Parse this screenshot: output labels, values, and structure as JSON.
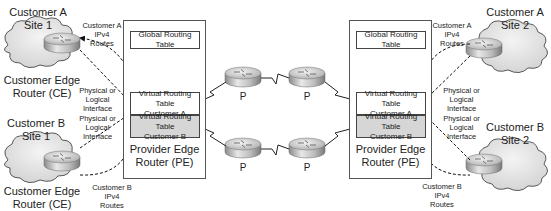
{
  "diagram": {
    "left_customer_a": {
      "site": "Customer A\nSite 1",
      "ce_label": "Customer Edge\nRouter (CE)",
      "routes": "Customer A\nIPv4 Routes",
      "interface": "Physical or\nLogical Interface"
    },
    "left_customer_b": {
      "site": "Customer B\nSite 1",
      "ce_label": "Customer Edge\nRouter (CE)",
      "routes": "Customer B\nIPv4 Routes",
      "interface": "Physical or\nLogical Interface"
    },
    "right_customer_a": {
      "site": "Customer A\nSite 2",
      "routes": "Customer A\nIPv4 Routes",
      "interface": "Physical or\nLogical Interface"
    },
    "right_customer_b": {
      "site": "Customer B\nSite 2",
      "routes": "Customer B\nIPv4 Routes",
      "interface": "Physical or\nLogical Interface"
    },
    "left_pe": {
      "global_table": "Global Routing Table",
      "vrf_a": "Virtual Routing Table\nCustomer A",
      "vrf_b": "Virtual Routing Table\nCustomer B",
      "label": "Provider Edge\nRouter (PE)"
    },
    "right_pe": {
      "global_table": "Global Routing Table",
      "vrf_a": "Virtual Routing Table\nCustomer A",
      "vrf_b": "Virtual Routing Table\nCustomer B",
      "label": "Provider Edge\nRouter (PE)"
    },
    "core_routers": [
      "P",
      "P",
      "P",
      "P"
    ],
    "colors": {
      "vrf_b_fill": "#d6d6d6",
      "cloud_fill": "#e8e8e8",
      "line": "#222222"
    }
  }
}
